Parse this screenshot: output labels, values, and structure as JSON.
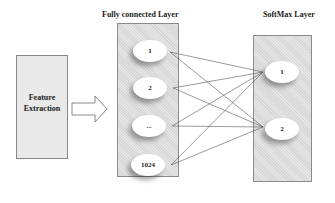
{
  "titles": {
    "fully_connected": "Fully connected Layer",
    "softmax": "SoftMax Layer"
  },
  "feature_box": {
    "line1": "Feature",
    "line2": "Extraction"
  },
  "fc_nodes": [
    "1",
    "2",
    "...",
    "1024"
  ],
  "softmax_nodes": [
    "1",
    "2"
  ],
  "colors": {
    "panel": "#dcdcdc",
    "node": "#ffffff",
    "edge": "#555555"
  }
}
